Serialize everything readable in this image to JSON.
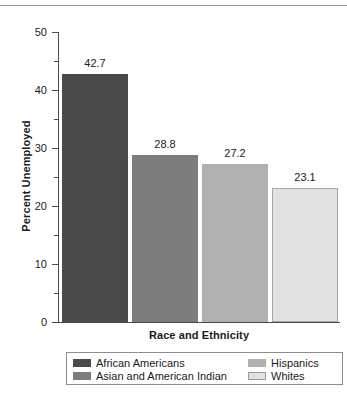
{
  "chart_data": {
    "type": "bar",
    "title": "",
    "xlabel": "Race and Ethnicity",
    "ylabel": "Percent Unemployed",
    "categories": [
      "African Americans",
      "Asian and American Indian",
      "Hispanics",
      "Whites"
    ],
    "values": [
      42.7,
      28.8,
      27.2,
      23.1
    ],
    "value_labels": [
      "42.7",
      "28.8",
      "27.2",
      "23.1"
    ],
    "colors": [
      "#4a4a4a",
      "#7d7d7d",
      "#b0b0b0",
      "#e2e2e2"
    ],
    "ylim": [
      0,
      50
    ],
    "ytick_labels": [
      "0",
      "10",
      "20",
      "30",
      "40",
      "50"
    ],
    "ytick_values": [
      0,
      10,
      20,
      30,
      40,
      50
    ],
    "yminor_values": [
      5,
      15,
      25,
      35,
      45
    ],
    "grid": false,
    "legend_position": "bottom"
  },
  "legend": {
    "left_column": [
      {
        "label": "African Americans",
        "color": "#4a4a4a",
        "bordered": false
      },
      {
        "label": "Asian and American Indian",
        "color": "#7d7d7d",
        "bordered": false
      }
    ],
    "right_column": [
      {
        "label": "Hispanics",
        "color": "#b0b0b0",
        "bordered": false
      },
      {
        "label": "Whites",
        "color": "#e2e2e2",
        "bordered": true
      }
    ]
  }
}
